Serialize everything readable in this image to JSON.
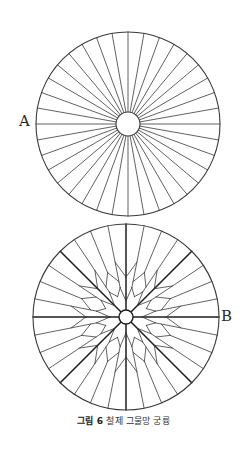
{
  "figure": {
    "labels": {
      "a": "A",
      "b": "B"
    },
    "caption": {
      "number": "그림 6",
      "text": "철제 그물망 궁륭"
    },
    "diagram_a": {
      "description": "radial vault plan with 36 uniform spokes around a central ring",
      "center": [
        128,
        124
      ],
      "radius": 92,
      "hub_radius": 12,
      "spoke_count": 36
    },
    "diagram_b": {
      "description": "radial vault plan with 8 thick main ribs, 24 thin ribs and a zig-zag star net around a central ring",
      "center": [
        126,
        317
      ],
      "radius": 93,
      "hub_radius": 7,
      "main_rib_count": 8,
      "thin_ribs_per_sector": 3
    },
    "colors": {
      "line": "#3a3a3a",
      "thick_line": "#1e1e1e",
      "background": "#ffffff"
    }
  }
}
